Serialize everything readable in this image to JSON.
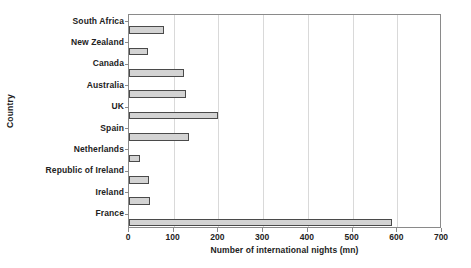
{
  "chart_data": {
    "type": "bar",
    "orientation": "horizontal",
    "title": "",
    "xlabel": "Number of international nights (mn)",
    "ylabel": "Country",
    "xlim": [
      0,
      700
    ],
    "ylim": null,
    "grid": true,
    "legend": false,
    "legend_position": "none",
    "xticks": [
      0,
      100,
      200,
      300,
      400,
      500,
      600,
      700
    ],
    "xtick_labels": [
      "0",
      "100",
      "200",
      "300",
      "400",
      "500",
      "600",
      "700"
    ],
    "categories": [
      "South Africa",
      "New Zealand",
      "Canada",
      "Australia",
      "UK",
      "Spain",
      "Netherlands",
      "Republic of Ireland",
      "Ireland",
      "France"
    ],
    "values": [
      78,
      42,
      122,
      128,
      198,
      135,
      25,
      45,
      48,
      588
    ],
    "series": [
      {
        "name": "Number of international nights (mn)",
        "values": [
          78,
          42,
          122,
          128,
          198,
          135,
          25,
          45,
          48,
          588
        ]
      }
    ],
    "colors": {
      "bar_fill": "#d3d3d3",
      "bar_border": "#4a4a4a",
      "grid": "#d9d9d9",
      "axis": "#8a8a8a",
      "text": "#222222",
      "background": "#ffffff"
    }
  }
}
